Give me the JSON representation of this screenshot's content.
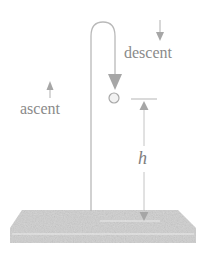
{
  "figure": {
    "labels": {
      "descent": "descent",
      "ascent": "ascent",
      "height": "h"
    },
    "colors": {
      "path": "#b9b9b9",
      "arrow": "#a6a6a6",
      "ground": "#cfcfcf",
      "ground_edge": "#e8e8e8",
      "text": "#8a8a8a",
      "ball_fill": "#f2f2f2",
      "ball_stroke": "#a8a8a8"
    }
  }
}
